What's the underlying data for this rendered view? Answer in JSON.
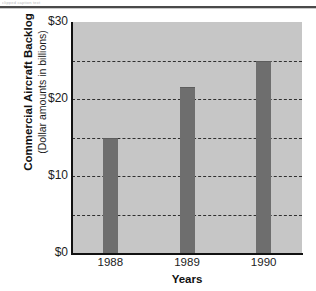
{
  "figure": {
    "top_caption_remnant": "clipped caption text",
    "background_color": "#ffffff",
    "plot_background_color": "#c6c6c6",
    "bar_color": "#6e6e6e",
    "gridline_color": "#2f2f2f",
    "axis_color": "#111111"
  },
  "chart_data": {
    "type": "bar",
    "title": "",
    "categories": [
      "1988",
      "1989",
      "1990"
    ],
    "values": [
      15,
      21.5,
      25
    ],
    "xlabel": "Years",
    "ylabel": "Commercial Aircraft Backlog",
    "ylabel_sub": "(Dollar amounts in billions)",
    "ylim": [
      0,
      30
    ],
    "ytick_values": [
      0,
      10,
      20,
      30
    ],
    "ytick_labels": [
      "$0",
      "$10",
      "$20",
      "$30"
    ],
    "gridline_values": [
      5,
      10,
      15,
      20,
      25
    ],
    "grid": true,
    "grid_style": "dashed",
    "legend": null,
    "annotations": []
  }
}
